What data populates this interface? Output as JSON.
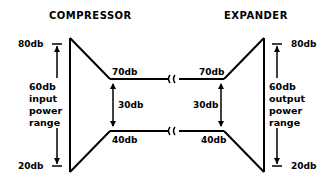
{
  "compressor": {
    "title": "COMPRESSOR",
    "top_level": "80db",
    "bottom_level": "20db",
    "range_lines": [
      "60db",
      "input",
      "power",
      "range"
    ],
    "out_top": "70db",
    "out_bottom": "40db",
    "out_range": "30db"
  },
  "expander": {
    "title": "EXPANDER",
    "top_level": "80db",
    "bottom_level": "20db",
    "range_lines": [
      "60db",
      "output",
      "power",
      "range"
    ],
    "in_top": "70db",
    "in_bottom": "40db",
    "in_range": "30db"
  },
  "colors": {
    "stroke": "#000000",
    "background": "#ffffff"
  }
}
